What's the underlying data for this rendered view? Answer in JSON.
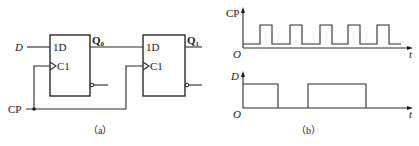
{
  "figure": {
    "panel_a": {
      "caption": "（a）",
      "inputs": {
        "d_label": "D",
        "cp_label": "CP"
      },
      "flipflop_0": {
        "d_pin": "1D",
        "clk_pin": "C1",
        "output_label": "Q",
        "output_sub": "0"
      },
      "flipflop_1": {
        "d_pin": "1D",
        "clk_pin": "C1",
        "output_label": "Q",
        "output_sub": "1"
      }
    },
    "panel_b": {
      "caption": "（b）",
      "cp_axis": {
        "y_label": "CP",
        "x_label": "t",
        "origin": "O"
      },
      "d_axis": {
        "y_label": "D",
        "x_label": "t",
        "origin": "O"
      }
    }
  },
  "waveforms": {
    "cp_pulses": [
      [
        260,
        272
      ],
      [
        290,
        302
      ],
      [
        320,
        332
      ],
      [
        348,
        360
      ],
      [
        377,
        389
      ]
    ],
    "d_high_intervals": [
      [
        243,
        278
      ],
      [
        308,
        366
      ]
    ]
  }
}
